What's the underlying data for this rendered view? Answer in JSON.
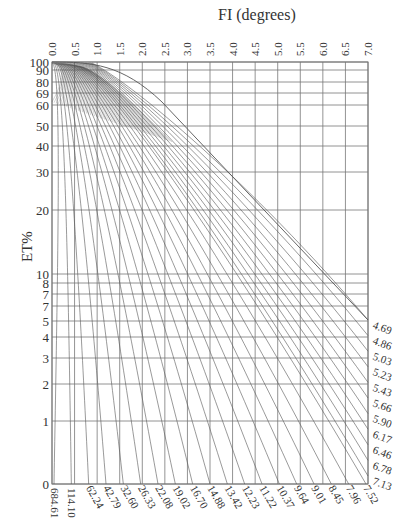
{
  "chart_data": {
    "type": "line",
    "title": "FI (degrees)",
    "xlabel": "FI (degrees)",
    "ylabel": "ET%",
    "x_axis_position": "top",
    "x_ticks": [
      "0.0",
      "0.5",
      "1.0",
      "1.5",
      "2.0",
      "2.5",
      "3.0",
      "3.5",
      "4.0",
      "4.5",
      "5.0",
      "5.5",
      "6.0",
      "6.5",
      "7.0"
    ],
    "xlim": [
      0.0,
      7.0
    ],
    "y_ticks": [
      {
        "label": "100",
        "y": 62
      },
      {
        "label": "90",
        "y": 70
      },
      {
        "label": "80",
        "y": 82
      },
      {
        "label": "69",
        "y": 93
      },
      {
        "label": "60",
        "y": 105
      },
      {
        "label": "50",
        "y": 126
      },
      {
        "label": "40",
        "y": 146
      },
      {
        "label": "30",
        "y": 172
      },
      {
        "label": "20",
        "y": 210
      },
      {
        "label": "10",
        "y": 274
      },
      {
        "label": "8",
        "y": 283
      },
      {
        "label": "7",
        "y": 294
      },
      {
        "label": "7",
        "y": 306
      },
      {
        "label": "5",
        "y": 321
      },
      {
        "label": "4",
        "y": 337
      },
      {
        "label": "3",
        "y": 358
      },
      {
        "label": "2",
        "y": 384
      },
      {
        "label": "1",
        "y": 421
      },
      {
        "label": "0",
        "y": 484
      }
    ],
    "curve_labels_bottom": [
      "684.61",
      "114.10",
      "62.24",
      "42.79",
      "32.60",
      "26.33",
      "22.08",
      "19.02",
      "16.70",
      "14.88",
      "13.42",
      "12.23",
      "11.22",
      "10.37",
      "9.64",
      "9.01",
      "8.45",
      "7.96",
      "7.52"
    ],
    "curve_labels_right": [
      "7.13",
      "6.78",
      "6.46",
      "6.17",
      "5.90",
      "5.66",
      "5.43",
      "5.23",
      "5.03",
      "4.86",
      "4.69"
    ],
    "grid": true,
    "legend": "none",
    "colors": {
      "grid": "#777777",
      "curves": "#555555",
      "text": "#333333"
    }
  }
}
